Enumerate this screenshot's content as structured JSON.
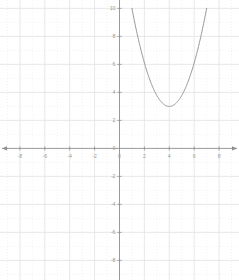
{
  "chart_data": {
    "type": "line",
    "title": "",
    "subtitle": "",
    "xlabel": "",
    "ylabel": "",
    "xlim": [
      -9.6,
      9.6
    ],
    "ylim": [
      -9.4,
      10.6
    ],
    "grid": true,
    "minor_grid": true,
    "legend": false,
    "legend_position": "none",
    "axes": {
      "x_axis_value": 0,
      "y_axis_value": 0,
      "arrows": [
        "left",
        "right"
      ],
      "major_step": 2,
      "minor_step": 1
    },
    "x_tick_labels": [
      "-8",
      "-6",
      "-4",
      "-2",
      "0",
      "2",
      "4",
      "6",
      "8"
    ],
    "x_tick_values": [
      -8,
      -6,
      -4,
      -2,
      0,
      2,
      4,
      6,
      8
    ],
    "y_tick_labels": [
      "10",
      "8",
      "6",
      "4",
      "2",
      "0",
      "-2",
      "-4",
      "-6",
      "-8"
    ],
    "y_tick_values": [
      10,
      8,
      6,
      4,
      2,
      0,
      -2,
      -4,
      -6,
      -8
    ],
    "series": [
      {
        "name": "parabola",
        "equation": "y = 0.78(x - 4)^2 + 3",
        "vertex": [
          4,
          3
        ],
        "color": "#8a8a8a",
        "x": [
          1.0,
          1.25,
          1.5,
          1.75,
          2.0,
          2.25,
          2.5,
          2.75,
          3.0,
          3.25,
          3.5,
          3.75,
          4.0,
          4.25,
          4.5,
          4.75,
          5.0,
          5.25,
          5.5,
          5.75,
          6.0,
          6.25,
          6.5,
          6.75,
          7.0
        ],
        "values": [
          10.02,
          9.29,
          8.61,
          7.95,
          7.34,
          6.77,
          6.24,
          5.74,
          3.0,
          3.44,
          3.2,
          3.05,
          3.0,
          3.05,
          3.2,
          3.44,
          3.78,
          4.2,
          4.76,
          5.39,
          6.12,
          6.95,
          7.87,
          8.89,
          10.02
        ],
        "visible_x_range": [
          1.0,
          7.0
        ],
        "visible_y_range": [
          3.0,
          10.0
        ]
      }
    ]
  },
  "colors": {
    "background": "#ffffff",
    "axis": "#8f8f8f",
    "major_grid": "#e2e2e2",
    "minor_grid": "#ececec",
    "curve": "#8a8a8a",
    "tick_text": "#9a9a9a"
  }
}
